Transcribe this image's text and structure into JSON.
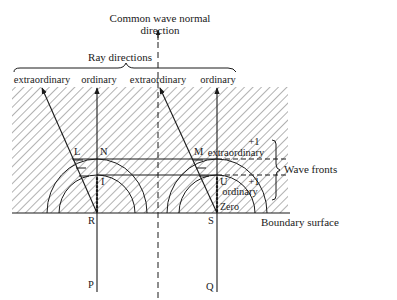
{
  "diagram": {
    "title_line1": "Common wave normal",
    "title_line2": "direction",
    "ray_directions_label": "Ray directions",
    "ray_labels": [
      "extraordinary",
      "ordinary",
      "extraordinary",
      "ordinary"
    ],
    "points": {
      "L": "L",
      "N": "N",
      "M": "M",
      "U": "U",
      "I": "I",
      "R": "R",
      "S": "S",
      "P": "P",
      "Q": "Q"
    },
    "zero_label": "Zero",
    "wave_front_upper_order": "+1",
    "wave_front_upper_type": "extraordinary",
    "wave_front_lower_order": "+1",
    "wave_front_lower_type": "ordinary",
    "wave_fronts_label": "Wave fronts",
    "boundary_label": "Boundary surface"
  }
}
